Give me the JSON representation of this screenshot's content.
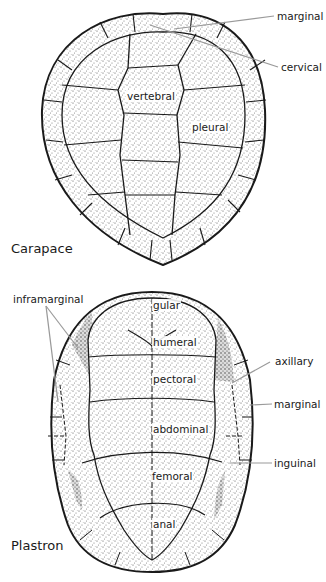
{
  "carapace": {
    "title": "Carapace",
    "labels": {
      "marginal": "marginal",
      "cervical": "cervical",
      "vertebral": "vertebral",
      "pleural": "pleural"
    }
  },
  "plastron": {
    "title": "Plastron",
    "labels": {
      "inframarginal": "inframarginal",
      "gular": "gular",
      "humeral": "humeral",
      "pectoral": "pectoral",
      "abdominal": "abdominal",
      "femoral": "femoral",
      "anal": "anal",
      "axillary": "axillary",
      "marginal": "marginal",
      "inguinal": "inguinal"
    }
  },
  "credit": "© Juan Barberis/Melissa Turk & The Artist Network",
  "colors": {
    "ink": "#1a1a1a",
    "stipple": "#c9c9c9",
    "leader": "#9a9a9a",
    "background": "#ffffff"
  }
}
